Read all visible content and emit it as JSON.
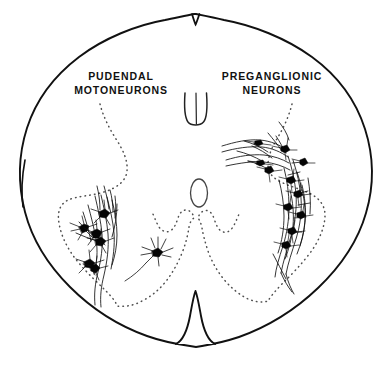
{
  "figure": {
    "background_color": "#ffffff",
    "stroke_color": "#000000",
    "dotted_color": "#4a4a4a",
    "labels": [
      {
        "id": "pudendal",
        "line1": "PUDENDAL",
        "line2": "MOTONEURONS",
        "side": "left"
      },
      {
        "id": "preganglionic",
        "line1": "PREGANGLIONIC",
        "line2": "NEURONS",
        "side": "right"
      }
    ],
    "structures": [
      {
        "name": "cord-outline",
        "style": "solid"
      },
      {
        "name": "gray-matter-boundary",
        "style": "dotted"
      },
      {
        "name": "central-canal",
        "style": "solid-ellipse"
      },
      {
        "name": "dorsal-median-septum",
        "style": "solid"
      },
      {
        "name": "ventral-median-fissure",
        "style": "solid"
      }
    ],
    "neuron_groups": [
      {
        "name": "pudendal-motoneurons",
        "location": "left ventral horn",
        "soma_count": 6,
        "soma_color": "#000000"
      },
      {
        "name": "preganglionic-neurons",
        "location": "right intermediolateral / intermediate gray",
        "soma_count": 11,
        "soma_color": "#000000"
      },
      {
        "name": "isolated-neuron",
        "location": "left intermediate gray",
        "soma_count": 1,
        "soma_color": "#000000"
      }
    ]
  }
}
